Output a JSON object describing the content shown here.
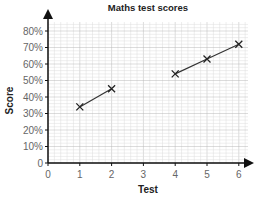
{
  "chart_data": {
    "type": "line",
    "title": "Maths test scores",
    "xlabel": "Test",
    "ylabel": "Score",
    "x_ticks": [
      "0",
      "1",
      "2",
      "3",
      "4",
      "5",
      "6"
    ],
    "y_ticks": [
      "0",
      "10%",
      "20%",
      "30%",
      "40%",
      "50%",
      "60%",
      "70%",
      "80%"
    ],
    "xlim": [
      0,
      6.5
    ],
    "ylim": [
      0,
      85
    ],
    "grid": true,
    "series": [
      {
        "name": "segment-1",
        "x": [
          1,
          2
        ],
        "values": [
          34,
          45
        ]
      },
      {
        "name": "segment-2",
        "x": [
          4,
          5,
          6
        ],
        "values": [
          54,
          63,
          72
        ]
      }
    ],
    "marker": "x",
    "colors": {
      "line": "#333333",
      "grid": "#cccccc",
      "axis": "#111111"
    }
  }
}
